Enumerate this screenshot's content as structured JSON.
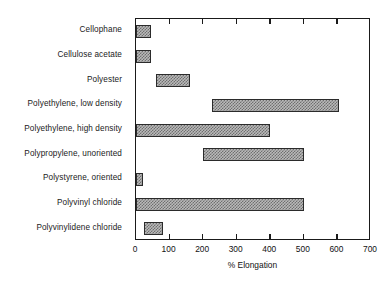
{
  "chart_data": {
    "type": "bar",
    "orientation": "horizontal",
    "title": "",
    "xlabel": "% Elongation",
    "ylabel": "",
    "xlim": [
      0,
      700
    ],
    "ylim": null,
    "grid": false,
    "legend": null,
    "xticks": [
      0,
      100,
      200,
      300,
      400,
      500,
      600,
      700
    ],
    "xtick_labels": [
      "0",
      "100",
      "200",
      "300",
      "400",
      "500",
      "600",
      "700"
    ],
    "categories": [
      "Cellophane",
      "Cellulose acetate",
      "Polyester",
      "Polyethylene, low density",
      "Polyethylene, high density",
      "Polypropylene, unoriented",
      "Polystyrene, oriented",
      "Polyvinyl chloride",
      "Polyvinylidene chloride"
    ],
    "ranges": [
      {
        "category": "Cellophane",
        "low": 0,
        "high": 45
      },
      {
        "category": "Cellulose acetate",
        "low": 0,
        "high": 45
      },
      {
        "category": "Polyester",
        "low": 60,
        "high": 160
      },
      {
        "category": "Polyethylene, low density",
        "low": 225,
        "high": 605
      },
      {
        "category": "Polyethylene, high density",
        "low": 0,
        "high": 400
      },
      {
        "category": "Polypropylene, unoriented",
        "low": 200,
        "high": 500
      },
      {
        "category": "Polystyrene, oriented",
        "low": 0,
        "high": 20
      },
      {
        "category": "Polyvinyl chloride",
        "low": 0,
        "high": 500
      },
      {
        "category": "Polyvinylidene chloride",
        "low": 25,
        "high": 80
      }
    ],
    "colors": {
      "bar_fill": "#b9b9b9",
      "bar_hatch": "#6f6f6f",
      "bar_edge": "#2b2b2b",
      "axis": "#1a1a1a",
      "background": "#ffffff",
      "text": "#111111"
    }
  }
}
